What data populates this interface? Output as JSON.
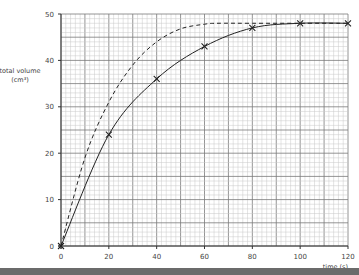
{
  "chart_data": {
    "type": "line",
    "title": "",
    "xlabel": "time (s)",
    "ylabel": "total volume (cm³)",
    "ylabel_lines": [
      "total volume",
      "(cm³)"
    ],
    "xlim": [
      0,
      120
    ],
    "ylim": [
      0,
      50
    ],
    "x_ticks": [
      0,
      20,
      40,
      60,
      80,
      100,
      120
    ],
    "y_ticks": [
      0,
      10,
      20,
      30,
      40,
      50
    ],
    "grid": true,
    "series": [
      {
        "name": "measured (solid, crosses)",
        "style": "solid",
        "markers": "x",
        "x": [
          0,
          20,
          40,
          60,
          80,
          100,
          120
        ],
        "values": [
          0,
          24,
          36,
          43,
          47,
          48,
          48
        ]
      },
      {
        "name": "faster reaction (dashed)",
        "style": "dashed",
        "markers": "none",
        "x": [
          0,
          10,
          20,
          30,
          40,
          50,
          60,
          65,
          80,
          100,
          120
        ],
        "values": [
          0,
          19,
          31,
          39,
          44,
          46.8,
          47.8,
          48,
          48,
          48,
          48
        ]
      }
    ]
  },
  "colors": {
    "line": "#222222",
    "grid_minor": "#c8c8c8",
    "grid_major": "#7a7a7a",
    "bottom_bar": "#6b6b6b"
  }
}
